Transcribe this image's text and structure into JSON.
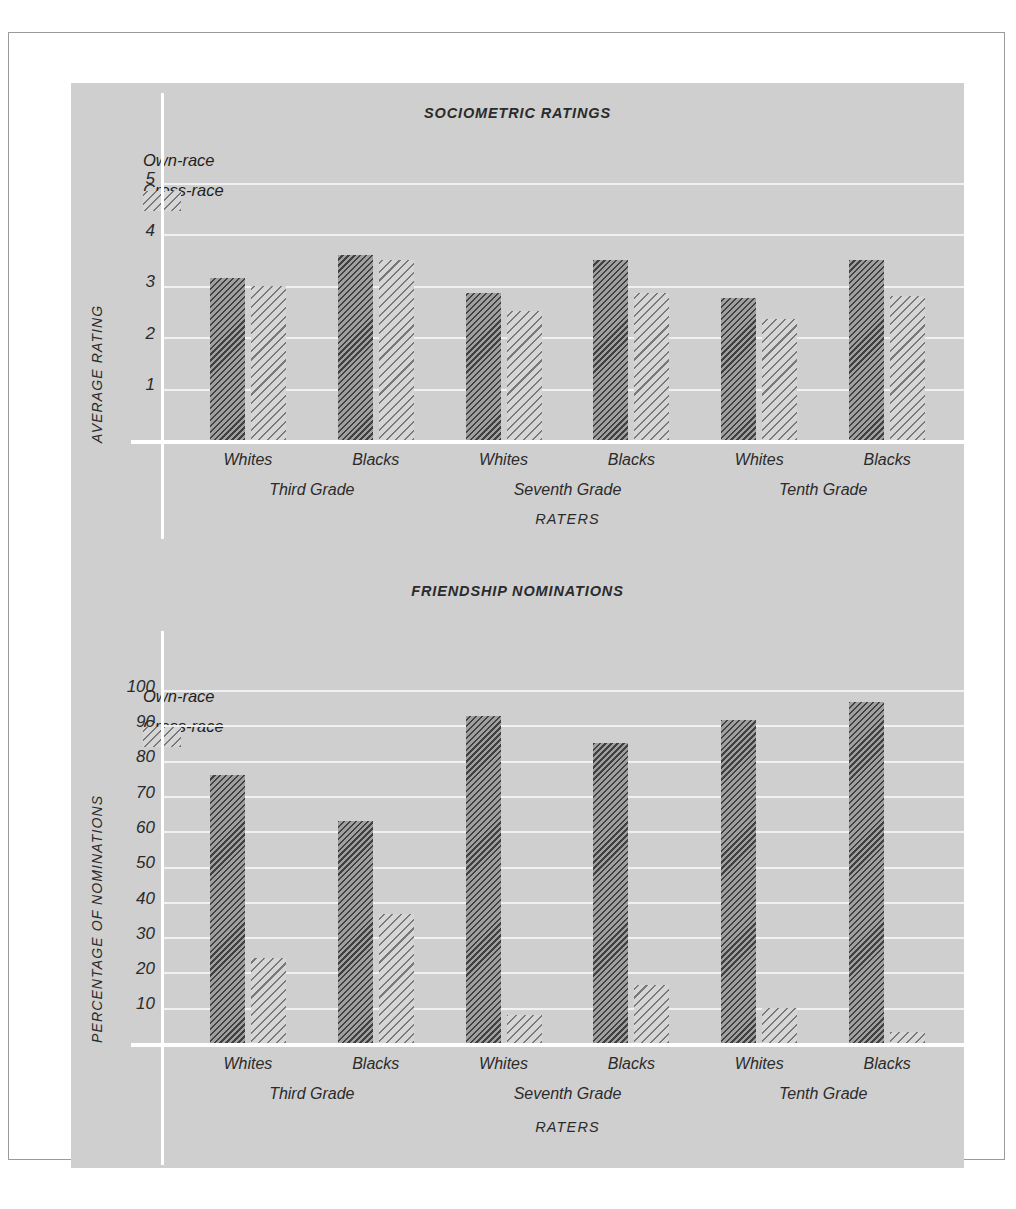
{
  "figure": {
    "panel_bg": "#cfcfcf",
    "frame_color": "#9b9b9b"
  },
  "legend": {
    "own_label": "Own-race",
    "cross_label": "Cross-race",
    "own_swatch": "dense-diagonal-hatch-swatch",
    "cross_swatch": "sparse-diagonal-hatch-swatch"
  },
  "chart_data": [
    {
      "type": "bar",
      "id": "sociometric-ratings",
      "title": "SOCIOMETRIC RATINGS",
      "xlabel": "RATERS",
      "ylabel": "AVERAGE RATING",
      "ylim": [
        0,
        5.8
      ],
      "yticks": [
        1,
        2,
        3,
        4,
        5
      ],
      "ytick_labels": [
        "1",
        "2",
        "3",
        "4",
        "5"
      ],
      "grid": true,
      "legend_position": "top-left",
      "categories": [
        "Whites",
        "Blacks",
        "Whites",
        "Blacks",
        "Whites",
        "Blacks"
      ],
      "groups": [
        "Third Grade",
        "Seventh Grade",
        "Tenth Grade"
      ],
      "series": [
        {
          "name": "Own-race",
          "values": [
            3.15,
            3.6,
            2.85,
            3.5,
            2.75,
            3.5
          ]
        },
        {
          "name": "Cross-race",
          "values": [
            3.0,
            3.5,
            2.5,
            2.85,
            2.35,
            2.8
          ]
        }
      ]
    },
    {
      "type": "bar",
      "id": "friendship-nominations",
      "title": "FRIENDSHIP NOMINATIONS",
      "xlabel": "RATERS",
      "ylabel": "PERCENTAGE OF NOMINATIONS",
      "ylim": [
        0,
        100
      ],
      "yticks": [
        10,
        20,
        30,
        40,
        50,
        60,
        70,
        80,
        90,
        100
      ],
      "ytick_labels": [
        "10",
        "20",
        "30",
        "40",
        "50",
        "60",
        "70",
        "80",
        "90",
        "100"
      ],
      "grid": true,
      "legend_position": "top-left",
      "categories": [
        "Whites",
        "Blacks",
        "Whites",
        "Blacks",
        "Whites",
        "Blacks"
      ],
      "groups": [
        "Third Grade",
        "Seventh Grade",
        "Tenth Grade"
      ],
      "series": [
        {
          "name": "Own-race",
          "values": [
            76,
            63,
            92.5,
            85,
            91.5,
            96.5
          ]
        },
        {
          "name": "Cross-race",
          "values": [
            24,
            36.5,
            8,
            16.5,
            10,
            3
          ]
        }
      ]
    }
  ]
}
